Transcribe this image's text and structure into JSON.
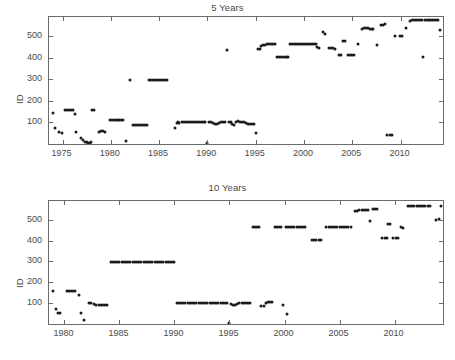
{
  "figure": {
    "width": 455,
    "height": 360,
    "background": "#ffffff",
    "marker_color": "#1c1c1c",
    "axis_color": "#6b6b6b",
    "text_color": "#4a4a4a"
  },
  "chart_data": [
    {
      "type": "scatter",
      "title": "5 Years",
      "xlabel": "",
      "ylabel": "ID",
      "xlim": [
        1973.6,
        2014.4
      ],
      "ylim": [
        0,
        590
      ],
      "xticks": [
        1975,
        1980,
        1985,
        1990,
        1995,
        2000,
        2005,
        2010
      ],
      "xticklabels": [
        "1975",
        "1980",
        "1985",
        "1990",
        "1995",
        "2000",
        "2005",
        "2010"
      ],
      "yticks": [
        100,
        200,
        300,
        400,
        500
      ],
      "yticklabels": [
        "100",
        "200",
        "300",
        "400",
        "500"
      ],
      "grid": false,
      "legend": null,
      "marker": "asterisk",
      "points": [
        [
          1974.0,
          143
        ],
        [
          1974.2,
          75
        ],
        [
          1974.6,
          55
        ],
        [
          1974.9,
          53
        ],
        [
          1975.3,
          157
        ],
        [
          1975.5,
          157
        ],
        [
          1975.7,
          157
        ],
        [
          1975.9,
          157
        ],
        [
          1976.1,
          157
        ],
        [
          1976.3,
          140
        ],
        [
          1976.4,
          57
        ],
        [
          1976.9,
          30
        ],
        [
          1977.1,
          18
        ],
        [
          1977.3,
          10
        ],
        [
          1977.5,
          8
        ],
        [
          1977.6,
          6
        ],
        [
          1977.8,
          6
        ],
        [
          1978.0,
          8
        ],
        [
          1978.1,
          160
        ],
        [
          1978.3,
          160
        ],
        [
          1978.8,
          57
        ],
        [
          1979.0,
          60
        ],
        [
          1979.2,
          60
        ],
        [
          1979.4,
          55
        ],
        [
          1979.9,
          110
        ],
        [
          1980.1,
          112
        ],
        [
          1980.3,
          112
        ],
        [
          1980.5,
          112
        ],
        [
          1980.7,
          112
        ],
        [
          1980.9,
          112
        ],
        [
          1981.1,
          112
        ],
        [
          1981.3,
          112
        ],
        [
          1981.6,
          14
        ],
        [
          1982.0,
          299
        ],
        [
          1982.3,
          88
        ],
        [
          1982.5,
          88
        ],
        [
          1982.7,
          88
        ],
        [
          1982.9,
          88
        ],
        [
          1983.1,
          88
        ],
        [
          1983.3,
          88
        ],
        [
          1983.5,
          88
        ],
        [
          1983.7,
          88
        ],
        [
          1984.0,
          299
        ],
        [
          1984.2,
          299
        ],
        [
          1984.4,
          299
        ],
        [
          1984.6,
          299
        ],
        [
          1984.8,
          299
        ],
        [
          1985.0,
          299
        ],
        [
          1985.2,
          299
        ],
        [
          1985.4,
          299
        ],
        [
          1985.6,
          299
        ],
        [
          1985.8,
          299
        ],
        [
          1986.6,
          74
        ],
        [
          1986.9,
          99
        ],
        [
          1987.0,
          103
        ],
        [
          1987.1,
          97
        ],
        [
          1987.4,
          100
        ],
        [
          1987.6,
          100
        ],
        [
          1987.8,
          100
        ],
        [
          1988.0,
          100
        ],
        [
          1988.2,
          100
        ],
        [
          1988.4,
          100
        ],
        [
          1988.6,
          100
        ],
        [
          1988.8,
          100
        ],
        [
          1989.0,
          100
        ],
        [
          1989.2,
          100
        ],
        [
          1989.4,
          100
        ],
        [
          1989.6,
          100
        ],
        [
          1989.8,
          100
        ],
        [
          1990.0,
          6
        ],
        [
          1990.2,
          100
        ],
        [
          1990.4,
          100
        ],
        [
          1990.6,
          97
        ],
        [
          1990.8,
          95
        ],
        [
          1991.0,
          95
        ],
        [
          1991.2,
          98
        ],
        [
          1991.4,
          100
        ],
        [
          1991.6,
          100
        ],
        [
          1991.8,
          100
        ],
        [
          1992.0,
          436
        ],
        [
          1992.2,
          100
        ],
        [
          1992.4,
          100
        ],
        [
          1992.6,
          92
        ],
        [
          1992.8,
          90
        ],
        [
          1993.0,
          103
        ],
        [
          1993.2,
          105
        ],
        [
          1993.4,
          104
        ],
        [
          1993.6,
          102
        ],
        [
          1993.8,
          100
        ],
        [
          1994.0,
          97
        ],
        [
          1994.2,
          95
        ],
        [
          1994.4,
          93
        ],
        [
          1994.6,
          92
        ],
        [
          1994.8,
          92
        ],
        [
          1995.0,
          50
        ],
        [
          1995.2,
          440
        ],
        [
          1995.4,
          443
        ],
        [
          1995.6,
          455
        ],
        [
          1995.8,
          460
        ],
        [
          1996.0,
          462
        ],
        [
          1996.2,
          463
        ],
        [
          1996.4,
          464
        ],
        [
          1996.6,
          465
        ],
        [
          1996.8,
          465
        ],
        [
          1997.0,
          465
        ],
        [
          1997.2,
          405
        ],
        [
          1997.4,
          404
        ],
        [
          1997.6,
          405
        ],
        [
          1997.8,
          405
        ],
        [
          1998.0,
          405
        ],
        [
          1998.2,
          405
        ],
        [
          1998.4,
          405
        ],
        [
          1998.6,
          464
        ],
        [
          1998.8,
          464
        ],
        [
          1999.0,
          464
        ],
        [
          1999.2,
          464
        ],
        [
          1999.4,
          464
        ],
        [
          1999.6,
          464
        ],
        [
          1999.8,
          464
        ],
        [
          2000.0,
          464
        ],
        [
          2000.2,
          464
        ],
        [
          2000.4,
          464
        ],
        [
          2000.6,
          464
        ],
        [
          2000.8,
          464
        ],
        [
          2001.0,
          464
        ],
        [
          2001.2,
          464
        ],
        [
          2001.4,
          452
        ],
        [
          2001.6,
          445
        ],
        [
          2002.0,
          520
        ],
        [
          2002.2,
          513
        ],
        [
          2002.6,
          447
        ],
        [
          2002.8,
          445
        ],
        [
          2003.0,
          445
        ],
        [
          2003.2,
          443
        ],
        [
          2003.6,
          412
        ],
        [
          2003.8,
          412
        ],
        [
          2004.0,
          480
        ],
        [
          2004.2,
          478
        ],
        [
          2004.6,
          412
        ],
        [
          2004.8,
          412
        ],
        [
          2005.0,
          412
        ],
        [
          2005.2,
          412
        ],
        [
          2005.6,
          466
        ],
        [
          2006.0,
          533
        ],
        [
          2006.2,
          538
        ],
        [
          2006.4,
          540
        ],
        [
          2006.6,
          538
        ],
        [
          2006.8,
          535
        ],
        [
          2007.0,
          533
        ],
        [
          2007.2,
          533
        ],
        [
          2007.6,
          460
        ],
        [
          2008.0,
          553
        ],
        [
          2008.2,
          555
        ],
        [
          2008.4,
          556
        ],
        [
          2008.6,
          40
        ],
        [
          2008.9,
          40
        ],
        [
          2009.1,
          40
        ],
        [
          2009.4,
          500
        ],
        [
          2009.9,
          500
        ],
        [
          2010.2,
          502
        ],
        [
          2010.6,
          540
        ],
        [
          2011.0,
          572
        ],
        [
          2011.2,
          574
        ],
        [
          2011.4,
          574
        ],
        [
          2011.6,
          574
        ],
        [
          2011.8,
          574
        ],
        [
          2012.0,
          574
        ],
        [
          2012.2,
          574
        ],
        [
          2012.3,
          404
        ],
        [
          2012.5,
          574
        ],
        [
          2012.7,
          574
        ],
        [
          2012.9,
          574
        ],
        [
          2013.1,
          574
        ],
        [
          2013.3,
          574
        ],
        [
          2013.5,
          574
        ],
        [
          2013.7,
          574
        ],
        [
          2013.9,
          574
        ],
        [
          2014.1,
          530
        ]
      ]
    },
    {
      "type": "scatter",
      "title": "10 Years",
      "xlabel": "",
      "ylabel": "ID",
      "xlim": [
        1978.6,
        2014.4
      ],
      "ylim": [
        0,
        590
      ],
      "xticks": [
        1980,
        1985,
        1990,
        1995,
        2000,
        2005,
        2010
      ],
      "xticklabels": [
        "1980",
        "1985",
        "1990",
        "1995",
        "2000",
        "2005",
        "2010"
      ],
      "yticks": [
        100,
        200,
        300,
        400,
        500
      ],
      "yticklabels": [
        "100",
        "200",
        "300",
        "400",
        "500"
      ],
      "grid": false,
      "legend": null,
      "marker": "asterisk",
      "points": [
        [
          1979.0,
          160
        ],
        [
          1979.2,
          74
        ],
        [
          1979.4,
          52
        ],
        [
          1979.6,
          52
        ],
        [
          1980.2,
          157
        ],
        [
          1980.4,
          160
        ],
        [
          1980.6,
          160
        ],
        [
          1980.8,
          160
        ],
        [
          1981.0,
          158
        ],
        [
          1981.3,
          140
        ],
        [
          1981.5,
          55
        ],
        [
          1981.8,
          20
        ],
        [
          1982.2,
          103
        ],
        [
          1982.4,
          103
        ],
        [
          1982.7,
          95
        ],
        [
          1982.9,
          92
        ],
        [
          1983.1,
          90
        ],
        [
          1983.3,
          90
        ],
        [
          1983.5,
          90
        ],
        [
          1983.7,
          90
        ],
        [
          1983.9,
          90
        ],
        [
          1984.2,
          299
        ],
        [
          1984.4,
          299
        ],
        [
          1984.6,
          299
        ],
        [
          1984.8,
          299
        ],
        [
          1985.0,
          299
        ],
        [
          1985.2,
          299
        ],
        [
          1985.4,
          299
        ],
        [
          1985.6,
          299
        ],
        [
          1985.8,
          299
        ],
        [
          1986.0,
          299
        ],
        [
          1986.2,
          299
        ],
        [
          1986.4,
          299
        ],
        [
          1986.6,
          299
        ],
        [
          1986.8,
          299
        ],
        [
          1987.0,
          299
        ],
        [
          1987.2,
          299
        ],
        [
          1987.4,
          299
        ],
        [
          1987.6,
          299
        ],
        [
          1987.8,
          299
        ],
        [
          1988.0,
          299
        ],
        [
          1988.2,
          299
        ],
        [
          1988.4,
          299
        ],
        [
          1988.6,
          299
        ],
        [
          1988.8,
          299
        ],
        [
          1989.0,
          299
        ],
        [
          1989.2,
          299
        ],
        [
          1989.4,
          299
        ],
        [
          1989.6,
          299
        ],
        [
          1989.8,
          299
        ],
        [
          1990.0,
          299
        ],
        [
          1990.2,
          100
        ],
        [
          1990.4,
          100
        ],
        [
          1990.6,
          100
        ],
        [
          1990.8,
          100
        ],
        [
          1991.0,
          100
        ],
        [
          1991.2,
          100
        ],
        [
          1991.4,
          100
        ],
        [
          1991.6,
          100
        ],
        [
          1991.8,
          100
        ],
        [
          1992.0,
          100
        ],
        [
          1992.2,
          100
        ],
        [
          1992.4,
          100
        ],
        [
          1992.6,
          100
        ],
        [
          1992.8,
          100
        ],
        [
          1993.0,
          100
        ],
        [
          1993.2,
          100
        ],
        [
          1993.4,
          100
        ],
        [
          1993.6,
          100
        ],
        [
          1993.8,
          100
        ],
        [
          1994.0,
          100
        ],
        [
          1994.2,
          100
        ],
        [
          1994.4,
          100
        ],
        [
          1994.6,
          100
        ],
        [
          1994.8,
          100
        ],
        [
          1995.0,
          6
        ],
        [
          1995.1,
          97
        ],
        [
          1995.3,
          93
        ],
        [
          1995.5,
          90
        ],
        [
          1995.7,
          95
        ],
        [
          1995.9,
          99
        ],
        [
          1996.1,
          100
        ],
        [
          1996.3,
          100
        ],
        [
          1996.5,
          100
        ],
        [
          1996.7,
          100
        ],
        [
          1996.9,
          100
        ],
        [
          1997.1,
          464
        ],
        [
          1997.3,
          464
        ],
        [
          1997.5,
          464
        ],
        [
          1997.7,
          464
        ],
        [
          1997.9,
          88
        ],
        [
          1998.1,
          87
        ],
        [
          1998.3,
          103
        ],
        [
          1998.5,
          104
        ],
        [
          1998.7,
          104
        ],
        [
          1998.9,
          104
        ],
        [
          1999.1,
          464
        ],
        [
          1999.3,
          464
        ],
        [
          1999.5,
          464
        ],
        [
          1999.7,
          464
        ],
        [
          1999.9,
          90
        ],
        [
          2000.1,
          464
        ],
        [
          2000.3,
          464
        ],
        [
          2000.5,
          464
        ],
        [
          2000.7,
          464
        ],
        [
          2000.9,
          464
        ],
        [
          2001.1,
          464
        ],
        [
          2001.3,
          464
        ],
        [
          2001.5,
          464
        ],
        [
          2001.7,
          464
        ],
        [
          2001.9,
          464
        ],
        [
          2000.2,
          48
        ],
        [
          2002.5,
          404
        ],
        [
          2002.7,
          404
        ],
        [
          2002.9,
          404
        ],
        [
          2003.1,
          404
        ],
        [
          2003.3,
          404
        ],
        [
          2003.8,
          464
        ],
        [
          2004.0,
          464
        ],
        [
          2004.2,
          464
        ],
        [
          2004.4,
          464
        ],
        [
          2004.6,
          464
        ],
        [
          2004.8,
          464
        ],
        [
          2005.0,
          464
        ],
        [
          2005.2,
          464
        ],
        [
          2005.4,
          464
        ],
        [
          2005.6,
          464
        ],
        [
          2005.8,
          464
        ],
        [
          2006.0,
          464
        ],
        [
          2006.4,
          540
        ],
        [
          2006.6,
          543
        ],
        [
          2006.8,
          545
        ],
        [
          2007.0,
          546
        ],
        [
          2007.2,
          545
        ],
        [
          2007.4,
          545
        ],
        [
          2007.6,
          545
        ],
        [
          2007.8,
          492
        ],
        [
          2008.0,
          552
        ],
        [
          2008.2,
          554
        ],
        [
          2008.4,
          554
        ],
        [
          2008.9,
          412
        ],
        [
          2009.1,
          412
        ],
        [
          2009.3,
          412
        ],
        [
          2009.4,
          480
        ],
        [
          2009.6,
          481
        ],
        [
          2009.9,
          412
        ],
        [
          2010.1,
          412
        ],
        [
          2010.3,
          412
        ],
        [
          2010.6,
          464
        ],
        [
          2010.8,
          461
        ],
        [
          2011.2,
          566
        ],
        [
          2011.4,
          566
        ],
        [
          2011.6,
          566
        ],
        [
          2011.8,
          566
        ],
        [
          2012.0,
          566
        ],
        [
          2012.2,
          566
        ],
        [
          2012.4,
          566
        ],
        [
          2012.6,
          566
        ],
        [
          2012.8,
          566
        ],
        [
          2013.0,
          566
        ],
        [
          2013.2,
          566
        ],
        [
          2013.8,
          500
        ],
        [
          2014.0,
          502
        ],
        [
          2014.2,
          566
        ]
      ]
    }
  ]
}
